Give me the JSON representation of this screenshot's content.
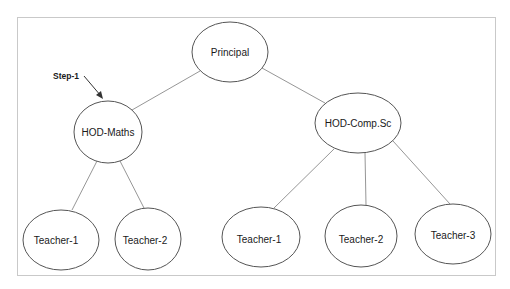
{
  "diagram": {
    "type": "hierarchy-tree",
    "annotation": {
      "label": "Step-1",
      "points_to": "HOD-Maths"
    },
    "nodes": {
      "principal": {
        "label": "Principal",
        "cx": 230,
        "cy": 52,
        "rx": 38,
        "ry": 30
      },
      "hod_maths": {
        "label": "HOD-Maths",
        "cx": 108,
        "cy": 132,
        "rx": 34,
        "ry": 31
      },
      "hod_compsc": {
        "label": "HOD-Comp.Sc",
        "cx": 358,
        "cy": 123,
        "rx": 43,
        "ry": 30
      },
      "maths_teacher_1": {
        "label": "Teacher-1",
        "cx": 61,
        "cy": 240,
        "rx": 38,
        "ry": 30
      },
      "maths_teacher_2": {
        "label": "Teacher-2",
        "cx": 148,
        "cy": 239,
        "rx": 33,
        "ry": 31
      },
      "compsc_teacher_1": {
        "label": "Teacher-1",
        "cx": 261,
        "cy": 237,
        "rx": 39,
        "ry": 30
      },
      "compsc_teacher_2": {
        "label": "Teacher-2",
        "cx": 361,
        "cy": 236,
        "rx": 36,
        "ry": 31
      },
      "compsc_teacher_3": {
        "label": "Teacher-3",
        "cx": 453,
        "cy": 234,
        "rx": 38,
        "ry": 30
      }
    },
    "edges": [
      {
        "from": "Principal",
        "to": "HOD-Maths"
      },
      {
        "from": "Principal",
        "to": "HOD-Comp.Sc"
      },
      {
        "from": "HOD-Maths",
        "to": "Teacher-1"
      },
      {
        "from": "HOD-Maths",
        "to": "Teacher-2"
      },
      {
        "from": "HOD-Comp.Sc",
        "to": "Teacher-1"
      },
      {
        "from": "HOD-Comp.Sc",
        "to": "Teacher-2"
      },
      {
        "from": "HOD-Comp.Sc",
        "to": "Teacher-3"
      }
    ]
  }
}
